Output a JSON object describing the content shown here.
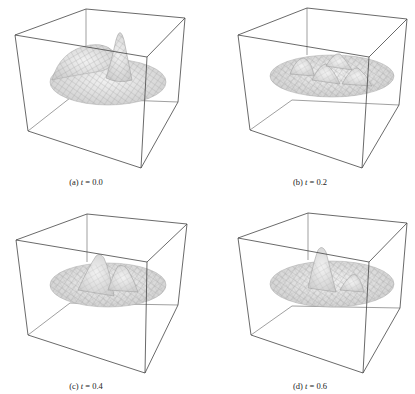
{
  "figure": {
    "panels": [
      {
        "label": "(a)",
        "var": "t",
        "value": "0.0",
        "caption_prefix": "(a) ",
        "caption_eq": " = 0.0"
      },
      {
        "label": "(b)",
        "var": "t",
        "value": "0.2",
        "caption_prefix": "(b) ",
        "caption_eq": " = 0.2"
      },
      {
        "label": "(c)",
        "var": "t",
        "value": "0.4",
        "caption_prefix": "(c) ",
        "caption_eq": " = 0.4"
      },
      {
        "label": "(d)",
        "var": "t",
        "value": "0.6",
        "caption_prefix": "(d) ",
        "caption_eq": " = 0.6"
      }
    ],
    "colors": {
      "box": "#555555",
      "surface": "#e4e4e4",
      "mesh": "#9a9a9a"
    }
  }
}
